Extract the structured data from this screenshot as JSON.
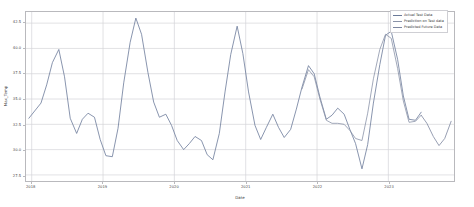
{
  "chart_data": {
    "type": "line",
    "title": "",
    "xlabel": "Date",
    "ylabel": "Max_Temp",
    "grid": true,
    "legend_position": "top-right",
    "xlim": [
      2017.92,
      2023.92
    ],
    "ylim": [
      26.9,
      43.6
    ],
    "yticks": [
      27.5,
      30.0,
      32.5,
      35.0,
      37.5,
      40.0,
      42.5
    ],
    "ytick_labels": [
      "27.5",
      "30.0",
      "32.5",
      "35.0",
      "37.5",
      "40.0",
      "42.5"
    ],
    "xticks": [
      2018,
      2019,
      2020,
      2021,
      2022,
      2023
    ],
    "xtick_labels": [
      "2018",
      "2019",
      "2020",
      "2021",
      "2022",
      "2023"
    ],
    "series": [
      {
        "name": "Actual Test Data",
        "color": "#6b7a99",
        "x": [
          2017.96,
          2018.13,
          2018.21,
          2018.29,
          2018.38,
          2018.46,
          2018.54,
          2018.63,
          2018.71,
          2018.79,
          2018.88,
          2018.96,
          2019.04,
          2019.13,
          2019.21,
          2019.29,
          2019.38,
          2019.46,
          2019.54,
          2019.63,
          2019.71,
          2019.79,
          2019.88,
          2019.96,
          2020.04,
          2020.13,
          2020.21,
          2020.29,
          2020.38,
          2020.46,
          2020.54,
          2020.63,
          2020.71,
          2020.79,
          2020.88,
          2020.96,
          2021.04,
          2021.13,
          2021.21,
          2021.29,
          2021.38,
          2021.46,
          2021.54,
          2021.63,
          2021.71,
          2021.79,
          2021.88,
          2021.96,
          2022.04,
          2022.13,
          2022.21,
          2022.29,
          2022.38,
          2022.46,
          2022.54,
          2022.63,
          2022.71,
          2022.79,
          2022.88,
          2022.96,
          2023.04,
          2023.13,
          2023.21,
          2023.29,
          2023.38,
          2023.46
        ],
        "values": [
          33.1,
          34.6,
          36.4,
          38.6,
          39.9,
          37.2,
          33.1,
          31.6,
          33.0,
          33.6,
          33.2,
          31.0,
          29.4,
          29.3,
          32.1,
          36.6,
          40.6,
          43.0,
          41.4,
          37.6,
          34.7,
          33.2,
          33.5,
          32.4,
          30.9,
          30.0,
          30.6,
          31.3,
          30.9,
          29.5,
          29.0,
          31.6,
          35.7,
          39.4,
          42.2,
          39.5,
          35.7,
          32.4,
          31.0,
          32.2,
          33.5,
          32.2,
          31.2,
          32.0,
          34.0,
          36.2,
          38.3,
          37.5,
          35.2,
          33.0,
          33.4,
          34.1,
          33.5,
          32.0,
          30.6,
          28.1,
          30.5,
          34.6,
          38.4,
          41.3,
          41.7,
          38.9,
          35.3,
          33.0,
          32.9,
          33.7
        ]
      },
      {
        "name": "Prediction on Test data",
        "color": "#8a93a8",
        "x": [
          2021.79,
          2021.88,
          2021.96,
          2022.04,
          2022.13,
          2022.21,
          2022.29,
          2022.38,
          2022.46,
          2022.54,
          2022.63,
          2022.71,
          2022.79,
          2022.88,
          2022.96,
          2023.04,
          2023.13,
          2023.21,
          2023.29,
          2023.38,
          2023.46
        ],
        "values": [
          36.0,
          37.9,
          37.2,
          35.0,
          32.9,
          32.6,
          32.6,
          32.5,
          31.9,
          31.1,
          30.9,
          33.6,
          37.0,
          39.9,
          41.4,
          41.0,
          38.0,
          34.8,
          32.7,
          32.8,
          33.4
        ]
      },
      {
        "name": "Predicted Future Data",
        "color": "#7d86a0",
        "x": [
          2023.46,
          2023.54,
          2023.63,
          2023.71,
          2023.79,
          2023.88
        ],
        "values": [
          33.4,
          32.6,
          31.3,
          30.4,
          31.1,
          32.8
        ]
      }
    ]
  },
  "legend": {
    "entries": [
      {
        "label": "Actual Test Data",
        "color": "#6b7a99"
      },
      {
        "label": "Prediction on Test data",
        "color": "#8a93a8"
      },
      {
        "label": "Predicted Future Data",
        "color": "#7d86a0"
      }
    ]
  }
}
